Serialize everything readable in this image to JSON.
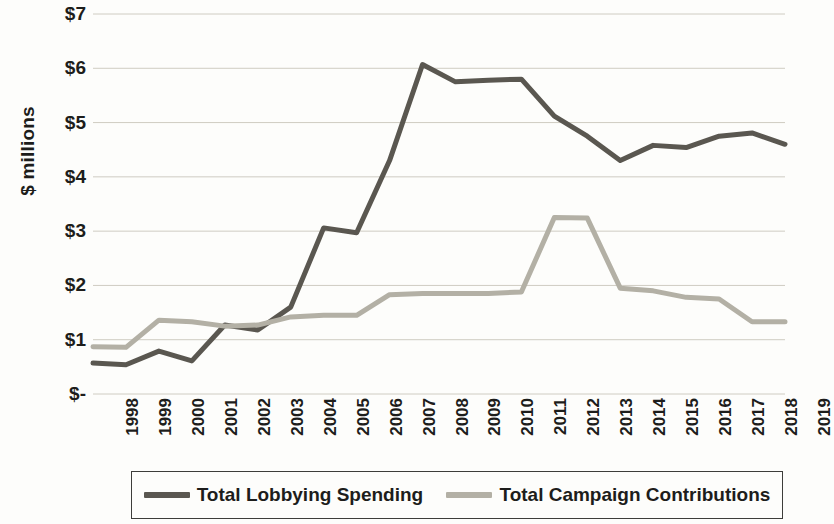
{
  "chart_data": {
    "type": "line",
    "title": "",
    "xlabel": "",
    "ylabel": "$ millions",
    "ylim": [
      0,
      7
    ],
    "grid": true,
    "legend_position": "bottom",
    "ytick_labels": [
      "$7",
      "$6",
      "$5",
      "$4",
      "$3",
      "$2",
      "$1",
      "$-"
    ],
    "ytick_values": [
      7,
      6,
      5,
      4,
      3,
      2,
      1,
      0
    ],
    "categories": [
      "1998",
      "1999",
      "2000",
      "2001",
      "2002",
      "2003",
      "2004",
      "2005",
      "2006",
      "2007",
      "2008",
      "2009",
      "2010",
      "2011",
      "2012",
      "2013",
      "2014",
      "2015",
      "2016",
      "2017",
      "2018",
      "2019"
    ],
    "series": [
      {
        "name": "Total Lobbying Spending",
        "color": "#5a5750",
        "values": [
          0.57,
          0.54,
          0.79,
          0.61,
          1.27,
          1.18,
          1.6,
          3.06,
          2.97,
          4.3,
          6.07,
          5.75,
          5.78,
          5.8,
          5.12,
          4.75,
          4.3,
          4.58,
          4.54,
          4.75,
          4.81,
          4.6
        ]
      },
      {
        "name": "Total Campaign Contributions",
        "color": "#b3b0a5",
        "values": [
          0.87,
          0.86,
          1.36,
          1.33,
          1.25,
          1.27,
          1.42,
          1.45,
          1.45,
          1.83,
          1.85,
          1.85,
          1.85,
          1.88,
          3.25,
          3.24,
          1.95,
          1.9,
          1.78,
          1.75,
          1.33,
          1.33
        ]
      }
    ]
  },
  "legend": {
    "items": [
      {
        "label": "Total Lobbying Spending",
        "color": "#5a5750"
      },
      {
        "label": "Total Campaign Contributions",
        "color": "#b3b0a5"
      }
    ]
  },
  "colors": {
    "background": "#fdfdfb",
    "gridline": "#cfccc2",
    "text": "#1d1d1b",
    "legend_border": "#3d3d3a"
  }
}
